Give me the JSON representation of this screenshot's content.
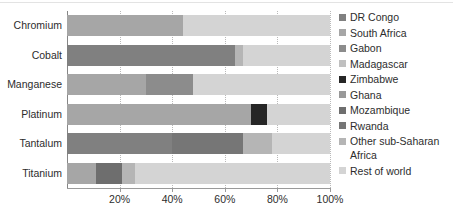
{
  "chart_data": {
    "type": "bar",
    "orientation": "horizontal",
    "stacked": true,
    "stack_mode": "percent",
    "title": "",
    "xlabel": "",
    "ylabel": "",
    "xlim": [
      0,
      100
    ],
    "grid": true,
    "legend_position": "right",
    "categories": [
      "Chromium",
      "Cobalt",
      "Manganese",
      "Platinum",
      "Tantalum",
      "Titanium"
    ],
    "xticks": [
      20,
      40,
      60,
      80,
      100
    ],
    "xtick_labels": [
      "20%",
      "40%",
      "60%",
      "80%",
      "100%"
    ],
    "series": [
      {
        "name": "DR Congo",
        "color": "#808080",
        "values": [
          0,
          64,
          0,
          0,
          40,
          0
        ]
      },
      {
        "name": "South Africa",
        "color": "#a6a6a6",
        "values": [
          44,
          0,
          30,
          70,
          0,
          11
        ]
      },
      {
        "name": "Gabon",
        "color": "#8c8c8c",
        "values": [
          0,
          0,
          18,
          0,
          0,
          0
        ]
      },
      {
        "name": "Madagascar",
        "color": "#c0c0c0",
        "values": [
          0,
          0,
          0,
          0,
          0,
          0
        ]
      },
      {
        "name": "Zimbabwe",
        "color": "#262626",
        "values": [
          0,
          0,
          0,
          6,
          0,
          0
        ]
      },
      {
        "name": "Ghana",
        "color": "#999999",
        "values": [
          0,
          0,
          0,
          0,
          0,
          0
        ]
      },
      {
        "name": "Mozambique",
        "color": "#6e6e6e",
        "values": [
          0,
          0,
          0,
          0,
          0,
          10
        ]
      },
      {
        "name": "Rwanda",
        "color": "#767676",
        "values": [
          0,
          0,
          0,
          0,
          27,
          0
        ]
      },
      {
        "name": "Other sub-Saharan Africa",
        "color": "#b5b5b5",
        "values": [
          0,
          3,
          0,
          0,
          11,
          5
        ]
      },
      {
        "name": "Rest of world",
        "color": "#d4d4d4",
        "values": [
          56,
          33,
          52,
          24,
          22,
          74
        ]
      }
    ]
  },
  "legend": {
    "items": [
      {
        "label": "DR Congo",
        "color": "#808080"
      },
      {
        "label": "South Africa",
        "color": "#a6a6a6"
      },
      {
        "label": "Gabon",
        "color": "#8c8c8c"
      },
      {
        "label": "Madagascar",
        "color": "#c0c0c0"
      },
      {
        "label": "Zimbabwe",
        "color": "#262626"
      },
      {
        "label": "Ghana",
        "color": "#999999"
      },
      {
        "label": "Mozambique",
        "color": "#6e6e6e"
      },
      {
        "label": "Rwanda",
        "color": "#767676"
      },
      {
        "label": "Other sub-Saharan",
        "label_line2": "Africa",
        "color": "#b5b5b5"
      },
      {
        "label": "Rest of world",
        "color": "#d4d4d4"
      }
    ]
  },
  "axes": {
    "gridline_color": "#b9b9b9",
    "axis_color": "#868686"
  }
}
